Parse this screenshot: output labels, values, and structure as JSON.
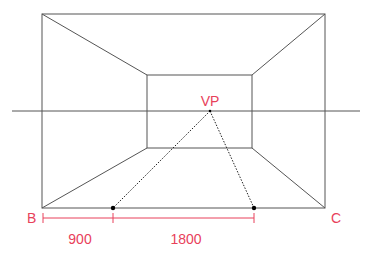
{
  "diagram": {
    "type": "one-point-perspective-room",
    "colors": {
      "lines": "#555555",
      "accent": "#e8415a",
      "dots": "#000000"
    },
    "labels": {
      "vanishing_point": "VP",
      "corner_left": "B",
      "corner_right": "C",
      "dimension_left": "900",
      "dimension_right": "1800"
    },
    "geometry": {
      "outer_rect": {
        "x1": 42,
        "y1": 14,
        "x2": 325,
        "y2": 208
      },
      "inner_rect": {
        "x1": 147,
        "y1": 75,
        "x2": 252,
        "y2": 148
      },
      "horizon_line": {
        "y": 111,
        "x1": 12,
        "x2": 360
      },
      "vanishing_point": {
        "x": 210,
        "y": 111
      },
      "floor_points": [
        {
          "x": 113,
          "y": 208
        },
        {
          "x": 254,
          "y": 208
        }
      ],
      "dimension_line": {
        "y": 218,
        "x_start": 43,
        "x_mid": 113,
        "x_end": 254
      }
    }
  }
}
